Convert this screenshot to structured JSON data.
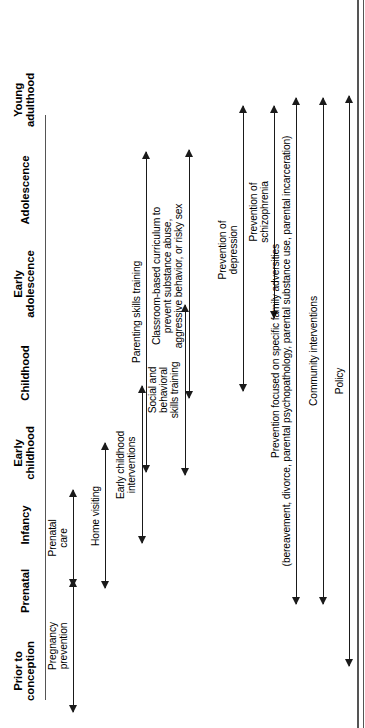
{
  "figure": {
    "type": "timeline-diagram",
    "orientation": "rotated-90-ccw",
    "stages": [
      {
        "id": "prior-to-conception",
        "label": "Prior to\nconception"
      },
      {
        "id": "prenatal",
        "label": "Prenatal"
      },
      {
        "id": "infancy",
        "label": "Infancy"
      },
      {
        "id": "early-childhood",
        "label": "Early\nchildhood"
      },
      {
        "id": "childhood",
        "label": "Childhood"
      },
      {
        "id": "early-adolescence",
        "label": "Early\nadolescence"
      },
      {
        "id": "adolescence",
        "label": "Adolescence"
      },
      {
        "id": "young-adulthood",
        "label": "Young\nadulthood"
      }
    ],
    "arrows": [
      {
        "id": "pregnancy-prevention",
        "label": "Pregnancy\nprevention"
      },
      {
        "id": "prenatal-care",
        "label": "Prenatal\ncare"
      },
      {
        "id": "home-visiting",
        "label": "Home visiting"
      },
      {
        "id": "early-childhood-interventions",
        "label": "Early childhood\ninterventions"
      },
      {
        "id": "social-behavioral-skills-training",
        "label": "Social and\nbehavioral\nskills training"
      },
      {
        "id": "parenting-skills-training",
        "label": "Parenting skills training"
      },
      {
        "id": "classroom-based-curriculum",
        "label": "Classroom-based curriculum to\nprevent substance abuse,\naggressive behavior, or risky sex"
      },
      {
        "id": "prevention-of-depression",
        "label": "Prevention of\ndepression"
      },
      {
        "id": "prevention-of-schizophrenia",
        "label": "Prevention of\nschizophrenia"
      },
      {
        "id": "family-adversities",
        "label": "Prevention focused on specific family adversities\n(bereavement, divorce, parental psychopathology, parental substance use, parental incarceration)"
      },
      {
        "id": "community-interventions",
        "label": "Community interventions"
      },
      {
        "id": "policy",
        "label": "Policy"
      }
    ],
    "colors": {
      "ink": "#1a1a1a",
      "rule": "#555555",
      "background": "#ffffff"
    }
  }
}
